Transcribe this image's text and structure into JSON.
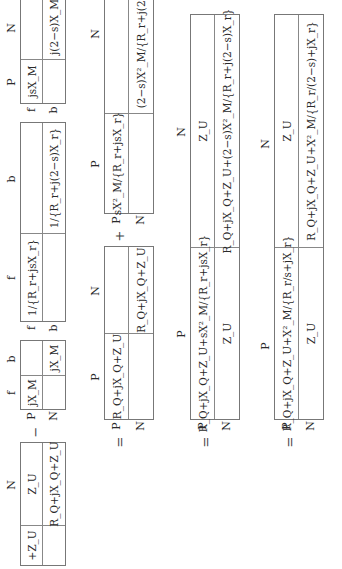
{
  "labels": {
    "P": "P",
    "N": "N",
    "f": "f",
    "b": "b"
  },
  "operators": {
    "minus": "−",
    "plus": "+",
    "equals": "="
  },
  "row1": {
    "impedance_matrix": {
      "col_headers": [
        "",
        "N"
      ],
      "cells": [
        "+Z_U",
        "Z_U",
        "",
        "R_Q+jX_Q+Z_U"
      ]
    },
    "mutual_matrix": {
      "col_headers": [
        "f",
        "b"
      ],
      "row_headers": [
        "P",
        "N"
      ],
      "cells": [
        "jX_M",
        "",
        "",
        "jX_M"
      ]
    },
    "rotor_matrix": {
      "col_headers": [
        "f",
        "b"
      ],
      "row_headers": [
        "f",
        "b"
      ],
      "cells": [
        "1/{R_r+jsX_r}",
        "",
        "",
        "1/{R_r+j(2−s)X_r}"
      ]
    },
    "slip_matrix": {
      "col_headers": [
        "P",
        "N"
      ],
      "row_headers": [
        "f",
        "b"
      ],
      "cells": [
        "jsX_M",
        "",
        "",
        "j(2−s)X_M"
      ]
    }
  },
  "row2": {
    "stator_matrix": {
      "col_headers": [
        "P",
        "N"
      ],
      "row_headers": [
        "P",
        "N"
      ],
      "cells": [
        "R_Q+jX_Q+Z_U",
        "",
        "",
        "R_Q+jX_Q+Z_U"
      ]
    },
    "rotor_reflected_matrix": {
      "col_headers": [
        "P",
        "N"
      ],
      "row_headers": [
        "P",
        "N"
      ],
      "cells": [
        "sX²_M/{R_r+jsX_r}",
        "",
        "",
        "(2−s)X²_M/{R_r+j(2−s)X_r}"
      ]
    }
  },
  "row3": {
    "combined_matrix": {
      "col_headers": [
        "P",
        "N"
      ],
      "row_headers": [
        "P",
        "N"
      ],
      "cells": [
        "R_Q+jX_Q+Z_U+sX²_M/{R_r+jsX_r}",
        "Z_U",
        "Z_U",
        "R_Q+jX_Q+Z_U+(2−s)X²_M/{R_r+j(2−s)X_r}"
      ]
    }
  },
  "row4": {
    "simplified_matrix": {
      "col_headers": [
        "P",
        "N"
      ],
      "row_headers": [
        "P",
        "N"
      ],
      "cells": [
        "R_Q+jX_Q+Z_U+X²_M/{R_r/s+jX_r}",
        "Z_U",
        "Z_U",
        "R_Q+jX_Q+Z_U+X²_M/{R_r/(2−s)+jX_r}"
      ]
    }
  }
}
